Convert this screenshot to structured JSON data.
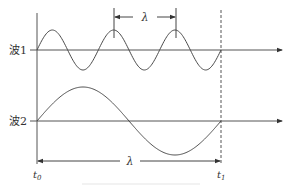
{
  "diagram": {
    "type": "wave-comparison",
    "colors": {
      "line": "#4a4a4a",
      "axis": "#555555",
      "text": "#333333",
      "background": "#ffffff"
    },
    "waves": [
      {
        "label": "波1",
        "cycles": 3,
        "axis_y": 50,
        "amplitude": 20
      },
      {
        "label": "波2",
        "cycles": 1,
        "axis_y": 121,
        "amplitude": 34
      }
    ],
    "wavelength_marks": [
      {
        "label": "λ",
        "target": "波1",
        "from_peak": 2,
        "to_peak": 3
      },
      {
        "label": "λ",
        "target": "波2",
        "span": "t0 to t1"
      }
    ],
    "time_labels": {
      "start": "t",
      "start_sub": "0",
      "end": "t",
      "end_sub": "1"
    },
    "time_span": {
      "x_start": 37,
      "x_end": 221
    }
  }
}
